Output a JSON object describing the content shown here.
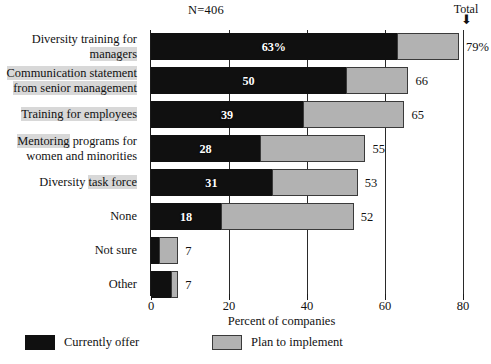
{
  "annotations": {
    "sample_size": "N=406",
    "total_header": "Total",
    "total_arrow_icon": "down-arrow-icon"
  },
  "legend": {
    "position": "bottom",
    "items": [
      {
        "label": "Currently offer",
        "color": "#101010",
        "key": "currently_offer"
      },
      {
        "label": "Plan to implement",
        "color": "#b2b2b2",
        "key": "plan_to_implement"
      }
    ]
  },
  "chart_data": {
    "type": "bar",
    "orientation": "horizontal",
    "stacked": true,
    "title": "",
    "subtitle": "",
    "xlabel": "Percent of companies",
    "ylabel": "",
    "xlim": [
      0,
      80
    ],
    "xticks": [
      0,
      20,
      40,
      60,
      80
    ],
    "xtick_labels": [
      "0",
      "20",
      "40",
      "60",
      "80"
    ],
    "grid": true,
    "sample_size": 406,
    "categories": [
      "Diversity training for managers",
      "Communication statement from senior management",
      "Training for employees",
      "Mentoring programs for women and minorities",
      "Diversity task force",
      "None",
      "Not sure",
      "Other"
    ],
    "series": [
      {
        "name": "Currently offer",
        "color": "#101010",
        "values": [
          63,
          50,
          39,
          28,
          31,
          18,
          2,
          5
        ]
      },
      {
        "name": "Plan to implement",
        "color": "#b2b2b2",
        "values": [
          16,
          16,
          26,
          27,
          22,
          34,
          5,
          2
        ]
      }
    ],
    "totals": [
      79,
      66,
      65,
      55,
      53,
      52,
      7,
      7
    ],
    "total_labels": [
      "79%",
      "66",
      "65",
      "55",
      "53",
      "52",
      "7",
      "7"
    ],
    "bar_value_labels": [
      "63%",
      "50",
      "39",
      "28",
      "31",
      "18",
      "",
      ""
    ]
  },
  "rows": [
    {
      "label_lines": [
        "Diversity training for",
        "managers"
      ],
      "dark": 63,
      "light": 16,
      "total": 79,
      "value_label": "63%",
      "total_label": "79%"
    },
    {
      "label_lines": [
        "Communication statement",
        "from senior management"
      ],
      "dark": 50,
      "light": 16,
      "total": 66,
      "value_label": "50",
      "total_label": "66"
    },
    {
      "label_lines": [
        "Training for employees"
      ],
      "dark": 39,
      "light": 26,
      "total": 65,
      "value_label": "39",
      "total_label": "65"
    },
    {
      "label_lines": [
        "Mentoring programs for",
        "women and minorities"
      ],
      "dark": 28,
      "light": 27,
      "total": 55,
      "value_label": "28",
      "total_label": "55"
    },
    {
      "label_lines": [
        "Diversity task force"
      ],
      "dark": 31,
      "light": 22,
      "total": 53,
      "value_label": "31",
      "total_label": "53"
    },
    {
      "label_lines": [
        "None"
      ],
      "dark": 18,
      "light": 34,
      "total": 52,
      "value_label": "18",
      "total_label": "52"
    },
    {
      "label_lines": [
        "Not sure"
      ],
      "dark": 2,
      "light": 5,
      "total": 7,
      "value_label": "",
      "total_label": "7"
    },
    {
      "label_lines": [
        "Other"
      ],
      "dark": 5,
      "light": 2,
      "total": 7,
      "value_label": "",
      "total_label": "7"
    }
  ]
}
